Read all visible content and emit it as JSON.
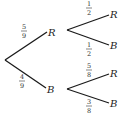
{
  "diagram": {
    "type": "probability-tree",
    "root": {
      "branches": [
        {
          "probability": {
            "num": "5",
            "den": "9"
          },
          "outcome": "R",
          "branches": [
            {
              "probability": {
                "num": "1",
                "den": "2"
              },
              "outcome": "R"
            },
            {
              "probability": {
                "num": "1",
                "den": "2"
              },
              "outcome": "B"
            }
          ]
        },
        {
          "probability": {
            "num": "4",
            "den": "9"
          },
          "outcome": "B",
          "branches": [
            {
              "probability": {
                "num": "5",
                "den": "8"
              },
              "outcome": "R"
            },
            {
              "probability": {
                "num": "3",
                "den": "8"
              },
              "outcome": "B"
            }
          ]
        }
      ]
    }
  }
}
